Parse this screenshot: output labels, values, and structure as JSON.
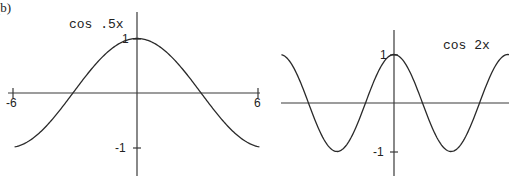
{
  "panel_label": "(b)",
  "chart_data": [
    {
      "type": "line",
      "title": "cos .5x",
      "function": "cos(0.5x)",
      "xlabel": "",
      "ylabel": "",
      "xlim": [
        -6,
        6
      ],
      "ylim": [
        -1,
        1
      ],
      "x_ticks": [
        -6,
        6
      ],
      "x_tick_labels": [
        "-6",
        "6"
      ],
      "y_ticks": [
        1,
        -1
      ],
      "y_tick_labels": [
        "1",
        "-1"
      ],
      "grid": false,
      "x": [
        -6,
        -5,
        -4,
        -3.14,
        -3,
        -2,
        -1,
        0,
        1,
        2,
        3,
        3.14,
        4,
        5,
        6
      ],
      "y": [
        -0.99,
        -0.8,
        -0.42,
        0.0,
        0.07,
        0.54,
        0.88,
        1.0,
        0.88,
        0.54,
        0.07,
        0.0,
        -0.42,
        -0.8,
        -0.99
      ]
    },
    {
      "type": "line",
      "title": "cos 2x",
      "function": "cos(2x)",
      "xlabel": "",
      "ylabel": "",
      "xlim": [
        -3.1,
        3.2
      ],
      "ylim": [
        -1,
        1
      ],
      "x_ticks": [],
      "x_tick_labels": [],
      "y_ticks": [
        1,
        -1
      ],
      "y_tick_labels": [
        "1",
        "-1"
      ],
      "grid": false,
      "x": [
        -3.14,
        -2.36,
        -1.57,
        -0.79,
        0,
        0.79,
        1.57,
        2.36,
        3.14
      ],
      "y": [
        1.0,
        0.0,
        -1.0,
        0.0,
        1.0,
        0.0,
        -1.0,
        0.0,
        1.0
      ]
    }
  ],
  "plots": {
    "left": {
      "title": "cos .5x",
      "tick_x_min": "-6",
      "tick_x_max": "6",
      "tick_y_max": "1",
      "tick_y_min": "-1"
    },
    "right": {
      "title": "cos 2x",
      "tick_y_max": "1",
      "tick_y_min": "-1"
    }
  },
  "colors": {
    "curve": "#2a2a2a",
    "axis": "#3a3a3a",
    "background": "#ffffff"
  }
}
